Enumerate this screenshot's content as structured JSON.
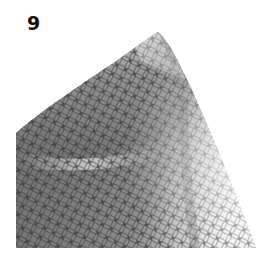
{
  "step": {
    "number": "9"
  },
  "figure": {
    "pattern": "interlocking-circles",
    "colors": {
      "fabric_dark": "#5f5f5f",
      "fabric_mid": "#8a8a8a",
      "fabric_light": "#d8d8d8",
      "pattern_line": "#2e2e2e",
      "background": "#ffffff"
    }
  }
}
